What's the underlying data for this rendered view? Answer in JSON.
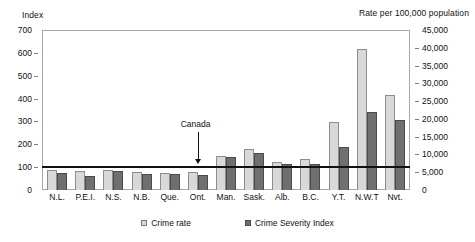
{
  "chart_data": {
    "type": "bar",
    "title": "",
    "left_axis_title": "Index",
    "right_axis_title": "Rate per 100,000 population",
    "xlabel": "",
    "categories": [
      "N.L.",
      "P.E.I.",
      "N.S.",
      "N.B.",
      "Que.",
      "Ont.",
      "Man.",
      "Sask.",
      "Alb.",
      "B.C.",
      "Y.T.",
      "N.W.T",
      "Nvt."
    ],
    "series": [
      {
        "name": "Crime rate",
        "axis": "right",
        "color": "#d8d8d8",
        "values": [
          5800,
          5400,
          5800,
          5100,
          4800,
          5000,
          9600,
          11600,
          8000,
          8700,
          19300,
          39800,
          27000
        ]
      },
      {
        "name": "Crime Severity Index",
        "axis": "left",
        "color": "#6f6f6f",
        "values": [
          75,
          60,
          85,
          70,
          70,
          68,
          145,
          165,
          115,
          115,
          190,
          345,
          310
        ]
      }
    ],
    "left_ticks": [
      "0",
      "100",
      "200",
      "300",
      "400",
      "500",
      "600",
      "700"
    ],
    "right_ticks": [
      "0",
      "5,000",
      "10,000",
      "15,000",
      "20,000",
      "25,000",
      "30,000",
      "35,000",
      "40,000",
      "45,000"
    ],
    "ylim_left": [
      0,
      700
    ],
    "ylim_right": [
      0,
      45000
    ],
    "grid": false,
    "legend_position": "bottom",
    "annotations": [
      {
        "label": "Canada",
        "value": 100,
        "type": "reference-line-arrow"
      }
    ]
  },
  "legend": {
    "items": [
      {
        "label": "Crime rate"
      },
      {
        "label": "Crime Severity Index"
      }
    ]
  }
}
